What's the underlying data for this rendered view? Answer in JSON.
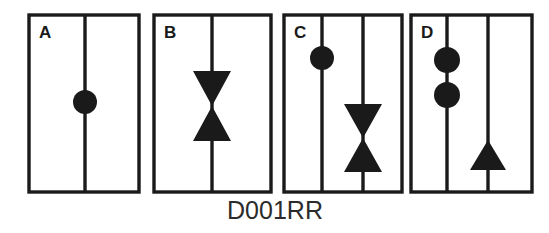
{
  "figure": {
    "caption": "D001RR",
    "background_color": "#ffffff",
    "ink_color": "#1a1a1a",
    "panel_count": 4,
    "panels": [
      {
        "label": "A",
        "frame": {
          "x": 29,
          "y": 15,
          "width": 110,
          "height": 177,
          "stroke_width": 3.4
        },
        "label_pos": {
          "x": 39,
          "y": 38
        },
        "lines": [
          {
            "name": "vertical-stem-1",
            "x": 85,
            "y1": 15,
            "y2": 192,
            "stroke_width": 3.4
          }
        ],
        "glyphs": [
          {
            "type": "circle",
            "name": "filled-circle",
            "cx": 85,
            "cy": 102,
            "r": 12
          }
        ]
      },
      {
        "label": "B",
        "frame": {
          "x": 154,
          "y": 15,
          "width": 117,
          "height": 177,
          "stroke_width": 3.4
        },
        "label_pos": {
          "x": 164,
          "y": 38
        },
        "lines": [
          {
            "name": "vertical-stem-1",
            "x": 212,
            "y1": 15,
            "y2": 192,
            "stroke_width": 3.4
          }
        ],
        "glyphs": [
          {
            "type": "bowtie",
            "name": "bowtie-hourglass",
            "cx": 212,
            "cy": 106,
            "width": 38,
            "height": 70
          }
        ]
      },
      {
        "label": "C",
        "frame": {
          "x": 284,
          "y": 15,
          "width": 118,
          "height": 177,
          "stroke_width": 3.4
        },
        "label_pos": {
          "x": 294,
          "y": 38
        },
        "lines": [
          {
            "name": "vertical-stem-1",
            "x": 322,
            "y1": 15,
            "y2": 192,
            "stroke_width": 3.4
          },
          {
            "name": "vertical-stem-2",
            "x": 363,
            "y1": 15,
            "y2": 192,
            "stroke_width": 3.4
          }
        ],
        "glyphs": [
          {
            "type": "circle",
            "name": "filled-circle",
            "cx": 322,
            "cy": 58,
            "r": 12
          },
          {
            "type": "bowtie",
            "name": "bowtie-hourglass",
            "cx": 363,
            "cy": 138,
            "width": 38,
            "height": 68
          }
        ]
      },
      {
        "label": "D",
        "frame": {
          "x": 411,
          "y": 15,
          "width": 121,
          "height": 177,
          "stroke_width": 3.4
        },
        "label_pos": {
          "x": 421,
          "y": 38
        },
        "lines": [
          {
            "name": "vertical-stem-1",
            "x": 447,
            "y1": 15,
            "y2": 192,
            "stroke_width": 3.4
          },
          {
            "name": "vertical-stem-2",
            "x": 488,
            "y1": 15,
            "y2": 192,
            "stroke_width": 3.4
          }
        ],
        "glyphs": [
          {
            "type": "circle",
            "name": "filled-circle-upper",
            "cx": 447,
            "cy": 60,
            "r": 13
          },
          {
            "type": "circle",
            "name": "filled-circle-lower",
            "cx": 447,
            "cy": 95,
            "r": 13
          },
          {
            "type": "triangle-up",
            "name": "triangle-up",
            "cx": 488,
            "cy": 155,
            "width": 36,
            "height": 30
          }
        ]
      }
    ],
    "caption_pos": {
      "x": 275,
      "y": 219
    }
  }
}
